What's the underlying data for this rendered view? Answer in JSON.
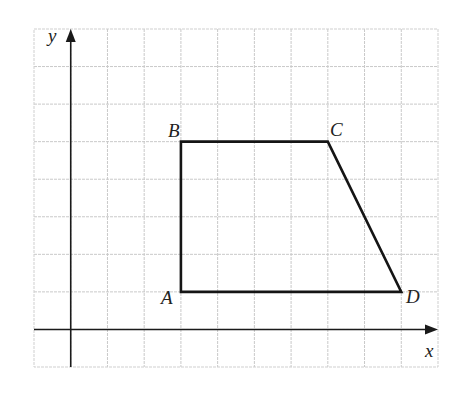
{
  "diagram": {
    "type": "coordinate-grid-quadrilateral",
    "grid": {
      "columns": 11,
      "rows": 9,
      "x_units_left_of_origin": 1,
      "x_units_right_of_origin": 10,
      "y_units_below_origin": 1,
      "y_units_above_origin": 8,
      "line_color": "#c9c9c9"
    },
    "axes": {
      "x_label": "x",
      "y_label": "y",
      "color": "#1a1a1a"
    },
    "shape": {
      "color": "#151515",
      "vertices": [
        {
          "label": "A",
          "x": 3,
          "y": 1
        },
        {
          "label": "B",
          "x": 3,
          "y": 5
        },
        {
          "label": "C",
          "x": 7,
          "y": 5
        },
        {
          "label": "D",
          "x": 9,
          "y": 1
        }
      ],
      "edges": [
        [
          "A",
          "B"
        ],
        [
          "B",
          "C"
        ],
        [
          "C",
          "D"
        ],
        [
          "D",
          "A"
        ]
      ]
    },
    "labels": {
      "A": "A",
      "B": "B",
      "C": "C",
      "D": "D"
    }
  }
}
